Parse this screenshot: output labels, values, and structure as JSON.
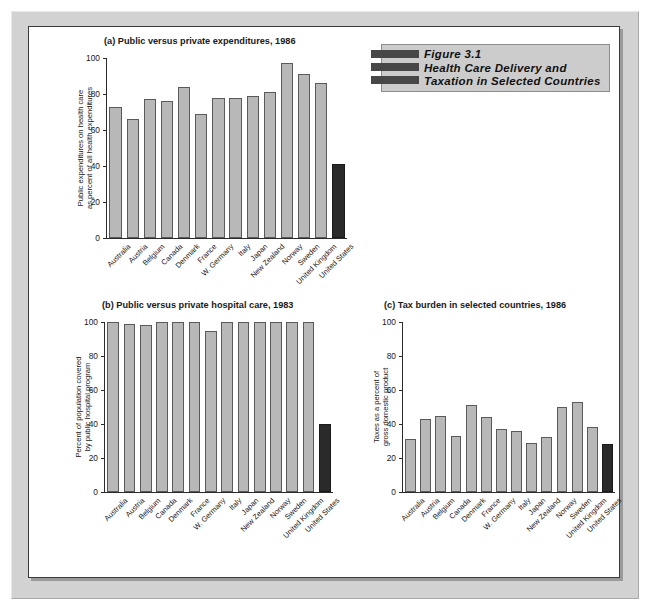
{
  "figure_box": {
    "line1": "Figure 3.1",
    "line2": "Health Care Delivery and",
    "line3": "Taxation in Selected Countries"
  },
  "colors": {
    "bar_fill": "#b8b8b8",
    "bar_stroke": "#5a5a5a",
    "highlight_fill": "#2a2a2a",
    "mat": "#d2d2d2",
    "figbox_bg": "#cccccc",
    "figbox_bar": "#474747",
    "panel_bg": "#ffffff",
    "axis": "#2b2b2b"
  },
  "countries": [
    "Australia",
    "Austria",
    "Belgium",
    "Canada",
    "Denmark",
    "France",
    "W. Germany",
    "Italy",
    "Japan",
    "New Zealand",
    "Norway",
    "Sweden",
    "United Kingdom",
    "United States"
  ],
  "chart_data": [
    {
      "id": "a",
      "type": "bar",
      "title": "(a) Public versus private expenditures, 1986",
      "ylabel_line1": "Public expenditures on health care",
      "ylabel_line2": "as percent of all health expenditures",
      "xlabel": "",
      "ylim": [
        0,
        100
      ],
      "yticks": [
        0,
        20,
        40,
        60,
        80,
        100
      ],
      "grid": false,
      "legend": "none",
      "highlight_index": 13,
      "categories": [
        "Australia",
        "Austria",
        "Belgium",
        "Canada",
        "Denmark",
        "France",
        "W. Germany",
        "Italy",
        "Japan",
        "New Zealand",
        "Norway",
        "Sweden",
        "United Kingdom",
        "United States"
      ],
      "values": [
        73,
        66,
        77,
        76,
        84,
        69,
        78,
        78,
        79,
        81,
        97,
        91,
        86,
        41
      ]
    },
    {
      "id": "b",
      "type": "bar",
      "title": "(b) Public versus private hospital care, 1983",
      "ylabel_line1": "Percent of population covered",
      "ylabel_line2": "by public hospital program",
      "xlabel": "",
      "ylim": [
        0,
        100
      ],
      "yticks": [
        0,
        20,
        40,
        60,
        80,
        100
      ],
      "grid": false,
      "legend": "none",
      "highlight_index": 13,
      "categories": [
        "Australia",
        "Austria",
        "Belgium",
        "Canada",
        "Denmark",
        "France",
        "W. Germany",
        "Italy",
        "Japan",
        "New Zealand",
        "Norway",
        "Sweden",
        "United Kingdom",
        "United States"
      ],
      "values": [
        100,
        99,
        98,
        100,
        100,
        100,
        95,
        100,
        100,
        100,
        100,
        100,
        100,
        40
      ]
    },
    {
      "id": "c",
      "type": "bar",
      "title": "(c) Tax burden in selected countries, 1986",
      "ylabel_line1": "Taxes as a percent of",
      "ylabel_line2": "gross domestic product",
      "xlabel": "",
      "ylim": [
        0,
        100
      ],
      "yticks": [
        0,
        20,
        40,
        60,
        80,
        100
      ],
      "grid": false,
      "legend": "none",
      "highlight_index": 13,
      "categories": [
        "Australia",
        "Austria",
        "Belgium",
        "Canada",
        "Denmark",
        "France",
        "W. Germany",
        "Italy",
        "Japan",
        "New Zealand",
        "Norway",
        "Sweden",
        "United Kingdom",
        "United States"
      ],
      "values": [
        31,
        43,
        45,
        33,
        51,
        44,
        37,
        36,
        29,
        32.5,
        50,
        53,
        38.5,
        28.5
      ]
    }
  ]
}
